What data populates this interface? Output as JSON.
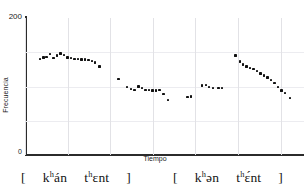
{
  "chart_data": {
    "type": "scatter",
    "title": "",
    "xlabel": "Tiempo",
    "ylabel": "Frecuencia",
    "ylim": [
      0,
      200
    ],
    "yticks": [
      "0",
      "200"
    ],
    "xticks": [],
    "grid": true,
    "legend": null,
    "series": [
      {
        "name": "[ kʰán tʰɛnt ] (acentuada)",
        "points": [
          {
            "x": 6.3,
            "y": 142
          },
          {
            "x": 8.0,
            "y": 144
          },
          {
            "x": 9.5,
            "y": 145
          },
          {
            "x": 11.2,
            "y": 149
          },
          {
            "x": 12.7,
            "y": 143
          },
          {
            "x": 14.4,
            "y": 147
          },
          {
            "x": 16.0,
            "y": 150
          },
          {
            "x": 17.7,
            "y": 148
          },
          {
            "x": 19.3,
            "y": 144
          },
          {
            "x": 20.9,
            "y": 143
          },
          {
            "x": 22.5,
            "y": 142
          },
          {
            "x": 24.1,
            "y": 142
          },
          {
            "x": 25.8,
            "y": 141
          },
          {
            "x": 27.4,
            "y": 141
          },
          {
            "x": 29.0,
            "y": 140
          },
          {
            "x": 30.6,
            "y": 139
          },
          {
            "x": 32.2,
            "y": 137
          },
          {
            "x": 34.2,
            "y": 131
          },
          {
            "x": 43.0,
            "y": 113
          },
          {
            "x": 47.0,
            "y": 101
          },
          {
            "x": 48.8,
            "y": 98
          },
          {
            "x": 50.4,
            "y": 97
          },
          {
            "x": 52.4,
            "y": 102
          },
          {
            "x": 54.0,
            "y": 100
          },
          {
            "x": 55.6,
            "y": 97
          },
          {
            "x": 57.3,
            "y": 97
          },
          {
            "x": 58.9,
            "y": 96
          },
          {
            "x": 60.5,
            "y": 96
          },
          {
            "x": 62.1,
            "y": 97
          },
          {
            "x": 63.9,
            "y": 91
          },
          {
            "x": 66.0,
            "y": 82
          }
        ]
      },
      {
        "name": "[ kʰən tʰɛ́nt ] (inacentuada)",
        "points": [
          {
            "x": 75.2,
            "y": 86
          },
          {
            "x": 76.8,
            "y": 87
          },
          {
            "x": 82.0,
            "y": 103
          },
          {
            "x": 83.7,
            "y": 104
          },
          {
            "x": 85.3,
            "y": 101
          },
          {
            "x": 87.0,
            "y": 100
          },
          {
            "x": 89.6,
            "y": 100
          },
          {
            "x": 91.2,
            "y": 100
          },
          {
            "x": 97.6,
            "y": 147
          },
          {
            "x": 99.5,
            "y": 138
          },
          {
            "x": 101.1,
            "y": 134
          },
          {
            "x": 102.7,
            "y": 131
          },
          {
            "x": 104.3,
            "y": 129
          },
          {
            "x": 105.9,
            "y": 127
          },
          {
            "x": 107.6,
            "y": 124
          },
          {
            "x": 109.2,
            "y": 121
          },
          {
            "x": 110.8,
            "y": 118
          },
          {
            "x": 112.4,
            "y": 115
          },
          {
            "x": 114.0,
            "y": 111
          },
          {
            "x": 115.7,
            "y": 107
          },
          {
            "x": 117.3,
            "y": 101
          },
          {
            "x": 118.9,
            "y": 96
          },
          {
            "x": 120.5,
            "y": 92
          },
          {
            "x": 122.8,
            "y": 85
          }
        ]
      }
    ]
  },
  "axes": {
    "y_top_tick": "200",
    "y_bottom_tick": "0",
    "y_axis_title": "Frecuencia",
    "x_axis_title": "Tiempo"
  },
  "transcriptions": {
    "left": {
      "open_bracket": "[",
      "word1_pre": "k",
      "word1_asp": "h",
      "word1_post": "án",
      "word2_pre": "t",
      "word2_asp": "h",
      "word2_post": "ɛnt",
      "close_bracket": "]",
      "full": "[ kʰán tʰɛnt ]"
    },
    "right": {
      "open_bracket": "[",
      "word1_pre": "k",
      "word1_asp": "h",
      "word1_post": "ən",
      "word2_pre": "t",
      "word2_asp": "h",
      "word2_post": "ɛ́nt",
      "close_bracket": "]",
      "full": "[ kʰən tʰɛ́nt ]"
    }
  },
  "colors": {
    "point": "#101010",
    "axis": "#2b2b2b",
    "grid_vertical": "#e2e2e6",
    "grid_horizontal": "#ececf0",
    "background": "#ffffff",
    "text": "#1a1a1a"
  }
}
